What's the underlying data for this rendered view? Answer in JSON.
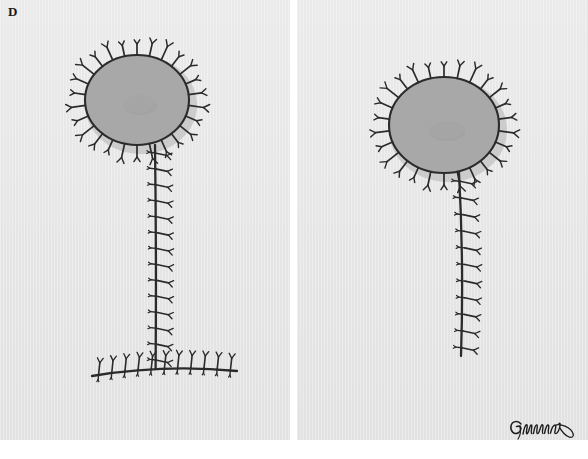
{
  "figure": {
    "panel_label": "D",
    "signature_text": "Gemma",
    "panel_count": 2
  },
  "colors": {
    "background": "#ffffff",
    "panel_paper": "#e9e9e9",
    "areola_fill": "#a8a8a8",
    "areola_shadow": "#c2c2c2",
    "nipple_shadow": "#9d9d9d",
    "ink": "#2b2b2b",
    "label_ink": "#1a1a1a"
  },
  "panels": [
    {
      "id": "panel-left",
      "name": "inverted-t-pattern",
      "areola": {
        "cx": 137,
        "cy": 100,
        "rx": 52,
        "ry": 45,
        "spike_count": 26
      },
      "nipple": {
        "cx": 139,
        "cy": 103,
        "rx": 17,
        "ry": 10
      },
      "stem": {
        "x": 155,
        "y_top": 145,
        "y_bottom": 368,
        "spike_count": 14,
        "spike_side": "right"
      },
      "base_line": {
        "x_left": 92,
        "x_right": 237,
        "y": 370,
        "spike_count": 11,
        "spike_side": "up"
      }
    },
    {
      "id": "panel-right",
      "name": "vertical-scar-pattern",
      "areola": {
        "cx": 444,
        "cy": 125,
        "rx": 55,
        "ry": 48,
        "spike_count": 26
      },
      "nipple": {
        "cx": 446,
        "cy": 129,
        "rx": 18,
        "ry": 10
      },
      "stem": {
        "x": 459,
        "y_top": 173,
        "y_bottom": 356,
        "spike_count": 11,
        "spike_side": "right"
      },
      "base_line": null
    }
  ]
}
